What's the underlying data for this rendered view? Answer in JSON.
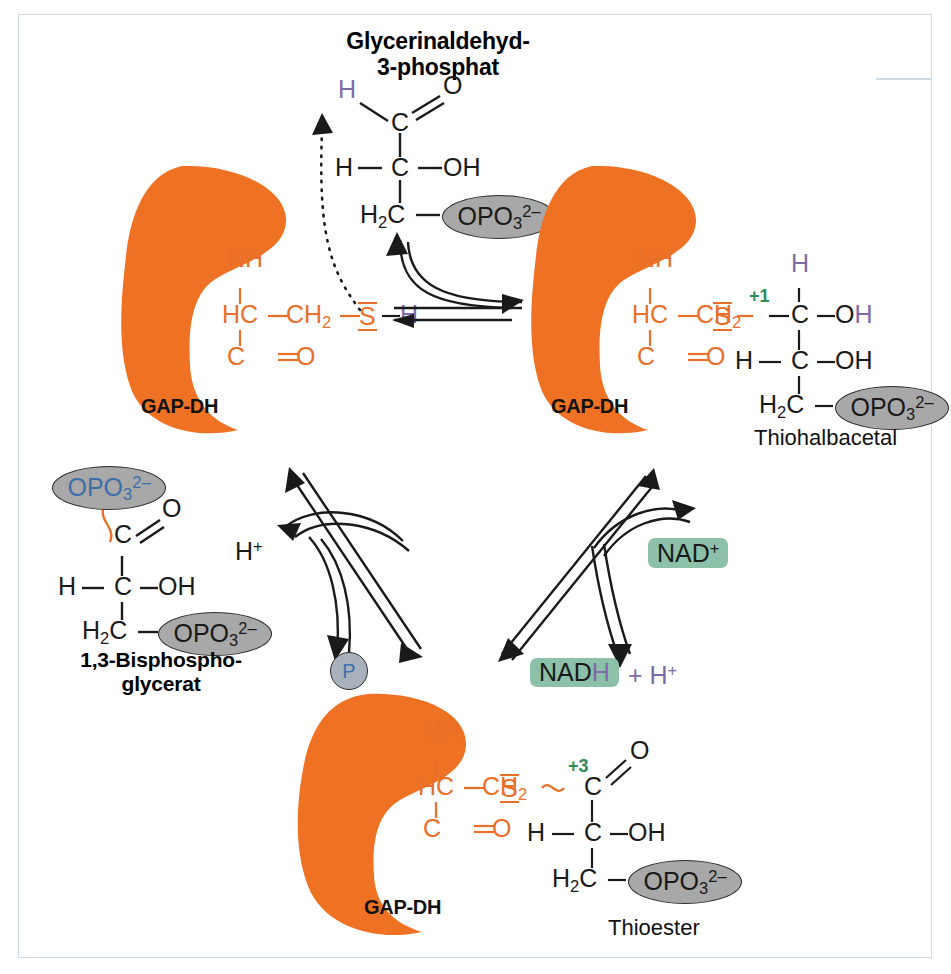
{
  "figure": {
    "title_top": "Glycerinaldehyd-3-phosphat",
    "domain": "biochemistry-reaction-mechanism",
    "accent_orange": "#ef7123",
    "accent_green": "#8cc0a8",
    "accent_gray": "#a8a8a8",
    "accent_purple": "#7d6ba8",
    "accent_blue": "#3d6fa8",
    "oxidation_green": "#2e8b57",
    "border_color": "#cfdbe4"
  },
  "labels": {
    "substrate_line1": "Glycerinaldehyd-",
    "substrate_line2": "3-phosphat",
    "product_line1": "1,3-Bisphospho-",
    "product_line2": "glycerat",
    "thiohemiacetal": "Thiohalbacetal",
    "thioester": "Thioester",
    "enzyme": "GAP-DH"
  },
  "cofactors": {
    "nad_plus": "NAD",
    "nad_plus_sup": "+",
    "nadh_stem": "NAD",
    "nadh_h": "H",
    "plus_proton_prefix": "+ H",
    "plus_proton_sup": "+",
    "proton": "H",
    "proton_sup": "+",
    "phosphate_icon": "P"
  },
  "atoms": {
    "H": "H",
    "C": "C",
    "O": "O",
    "OH": "OH",
    "S": "S",
    "NH": "NH",
    "HC": "HC",
    "CO_C": "C",
    "CO_O": "O",
    "CH2_stem": "CH",
    "CH2_sub": "2",
    "H2C_stem": "H",
    "H2C_sub": "2",
    "H2C_tail": "C",
    "phosphate_stem": "OPO",
    "phosphate_sub": "3",
    "phosphate_sup": "2–",
    "ox_plus1": "+1",
    "ox_plus3": "+3"
  },
  "steps": {
    "substrate_binding": "aldehyde binds active-site cysteine thiol",
    "oxidation": "NAD+ oxidises thiohemiacetal to thioester, releasing NADH + H+",
    "phosphorolysis": "inorganic phosphate Pi attacks thioester to give 1,3-bisphosphoglycerate"
  }
}
